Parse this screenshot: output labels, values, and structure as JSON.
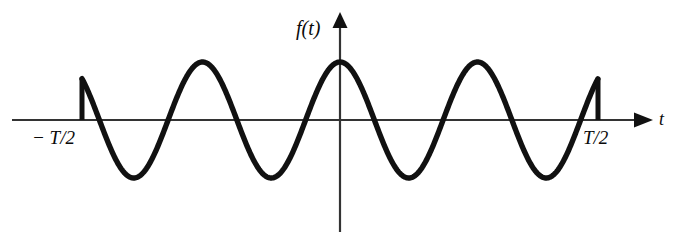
{
  "figure": {
    "kind": "math-plot",
    "background_color": "#ffffff",
    "ink_color": "#111111",
    "width": 675,
    "height": 242
  },
  "labels": {
    "y_axis": "f(t)",
    "x_axis": "t",
    "left_tick": "− T/2",
    "right_tick": "T/2"
  },
  "chart_data": {
    "type": "line",
    "title": "",
    "xlabel": "t",
    "ylabel": "f(t)",
    "grid": false,
    "legend": null,
    "function": "A*cos(2*pi*t/T0)",
    "amplitude": 1.0,
    "cycles_shown": 3.75,
    "axis_origin_px": {
      "x": 340,
      "y": 120
    },
    "pixels": {
      "x_axis_y": 120,
      "x_axis_start": 12,
      "x_axis_arrow_tip": 652,
      "y_axis_x": 340,
      "y_axis_top": 14,
      "y_axis_bottom": 232,
      "wave_period": 137.5,
      "wave_amplitude": 58,
      "wave_left_edge": 82,
      "wave_right_edge": 598,
      "jump_top_y": 82,
      "peak_y": 62,
      "trough_y": 180
    },
    "x": [
      -0.9375,
      -0.75,
      -0.5,
      -0.25,
      0,
      0.25,
      0.5,
      0.75,
      0.9375
    ],
    "y": [
      0.69,
      -1.0,
      0.0,
      1.0,
      0.0,
      -1.0,
      0.0,
      1.0,
      0.69
    ],
    "xlim": [
      -1.05,
      1.05
    ],
    "ylim": [
      -1.12,
      1.12
    ],
    "annotations": [
      {
        "text": "− T/2",
        "x": -0.9375,
        "y": 0,
        "note": "left truncation point with vertical jump"
      },
      {
        "text": "T/2",
        "x": 0.9375,
        "y": 0,
        "note": "right truncation point with vertical jump"
      }
    ],
    "peaks_px_x": [
      203,
      340,
      478
    ],
    "troughs_px_x": [
      135,
      272,
      409,
      546
    ],
    "zero_crossings_px_x": [
      100,
      169,
      237,
      306,
      374,
      443,
      511,
      580
    ]
  }
}
